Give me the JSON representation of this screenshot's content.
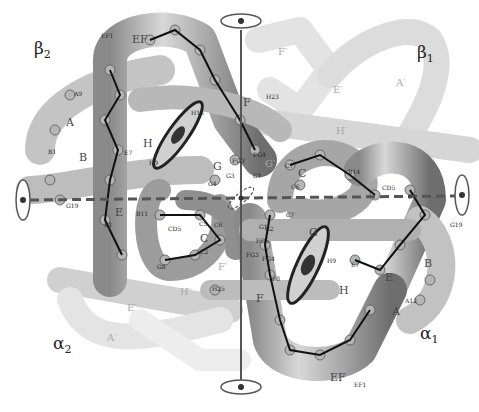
{
  "diagram": {
    "colors": {
      "background": "#ffffff",
      "tube_dark": "#7a7a7a",
      "tube_mid": "#a8a8a8",
      "tube_light": "#d4d4d4",
      "ghost": "#e6e6e6",
      "heme": "#555555",
      "axis": "#555555"
    },
    "chains": [
      {
        "id": "beta2",
        "symbol": "β",
        "sub": "2",
        "x": 34,
        "y": 40
      },
      {
        "id": "beta1",
        "symbol": "β",
        "sub": "1",
        "x": 417,
        "y": 44
      },
      {
        "id": "alpha2",
        "symbol": "α",
        "sub": "2",
        "x": 53,
        "y": 335
      },
      {
        "id": "alpha1",
        "symbol": "α",
        "sub": "1",
        "x": 420,
        "y": 325
      }
    ],
    "helix_labels": [
      {
        "text": "EF",
        "x": 132,
        "y": 34
      },
      {
        "text": "F",
        "x": 243,
        "y": 97
      },
      {
        "text": "H",
        "x": 143,
        "y": 138
      },
      {
        "text": "B",
        "x": 79,
        "y": 152
      },
      {
        "text": "A",
        "x": 66,
        "y": 117
      },
      {
        "text": "G",
        "x": 213,
        "y": 161
      },
      {
        "text": "E",
        "x": 115,
        "y": 207
      },
      {
        "text": "C",
        "x": 200,
        "y": 233
      },
      {
        "text": "C",
        "x": 298,
        "y": 168
      },
      {
        "text": "G",
        "x": 309,
        "y": 227
      },
      {
        "text": "H",
        "x": 339,
        "y": 285
      },
      {
        "text": "E",
        "x": 385,
        "y": 272
      },
      {
        "text": "B",
        "x": 424,
        "y": 258
      },
      {
        "text": "A",
        "x": 392,
        "y": 306
      },
      {
        "text": "F",
        "x": 256,
        "y": 293
      },
      {
        "text": "EF",
        "x": 330,
        "y": 372
      }
    ],
    "ghost_labels": [
      {
        "text": "F′",
        "x": 278,
        "y": 47
      },
      {
        "text": "E′",
        "x": 333,
        "y": 85
      },
      {
        "text": "A′",
        "x": 396,
        "y": 78
      },
      {
        "text": "H′",
        "x": 336,
        "y": 126
      },
      {
        "text": "G′",
        "x": 265,
        "y": 159
      },
      {
        "text": "F′",
        "x": 218,
        "y": 262
      },
      {
        "text": "H′",
        "x": 180,
        "y": 287
      },
      {
        "text": "E′",
        "x": 127,
        "y": 303
      },
      {
        "text": "A′",
        "x": 107,
        "y": 333
      }
    ],
    "residue_labels": [
      {
        "text": "EF1",
        "x": 101,
        "y": 33
      },
      {
        "text": "A9",
        "x": 74,
        "y": 91
      },
      {
        "text": "H15",
        "x": 191,
        "y": 110
      },
      {
        "text": "H23",
        "x": 266,
        "y": 94
      },
      {
        "text": "B1",
        "x": 48,
        "y": 149
      },
      {
        "text": "E7",
        "x": 124,
        "y": 150
      },
      {
        "text": "H9",
        "x": 149,
        "y": 160
      },
      {
        "text": "G19",
        "x": 66,
        "y": 203
      },
      {
        "text": "E1",
        "x": 104,
        "y": 222
      },
      {
        "text": "B11",
        "x": 136,
        "y": 211
      },
      {
        "text": "CD5",
        "x": 168,
        "y": 226
      },
      {
        "text": "FG4",
        "x": 253,
        "y": 152
      },
      {
        "text": "FG3",
        "x": 232,
        "y": 158
      },
      {
        "text": "G3",
        "x": 226,
        "y": 173
      },
      {
        "text": "G4",
        "x": 208,
        "y": 181
      },
      {
        "text": "G1",
        "x": 253,
        "y": 173
      },
      {
        "text": "C7",
        "x": 285,
        "y": 163
      },
      {
        "text": "C6",
        "x": 291,
        "y": 184
      },
      {
        "text": "B14",
        "x": 348,
        "y": 169
      },
      {
        "text": "CD5",
        "x": 382,
        "y": 185
      },
      {
        "text": "E1",
        "x": 408,
        "y": 194
      },
      {
        "text": "G19",
        "x": 450,
        "y": 222
      },
      {
        "text": "C7",
        "x": 286,
        "y": 212
      },
      {
        "text": "G1",
        "x": 259,
        "y": 224
      },
      {
        "text": "G2",
        "x": 265,
        "y": 226
      },
      {
        "text": "FG5",
        "x": 256,
        "y": 238
      },
      {
        "text": "FG3",
        "x": 246,
        "y": 252
      },
      {
        "text": "FG4",
        "x": 262,
        "y": 256
      },
      {
        "text": "H9",
        "x": 327,
        "y": 258
      },
      {
        "text": "E7",
        "x": 351,
        "y": 262
      },
      {
        "text": "F8",
        "x": 272,
        "y": 276
      },
      {
        "text": "H25",
        "x": 212,
        "y": 286
      },
      {
        "text": "A12",
        "x": 405,
        "y": 298
      },
      {
        "text": "EF1",
        "x": 354,
        "y": 382
      },
      {
        "text": "C5",
        "x": 199,
        "y": 221
      },
      {
        "text": "C6",
        "x": 214,
        "y": 222
      },
      {
        "text": "C2",
        "x": 200,
        "y": 249
      },
      {
        "text": "G8",
        "x": 157,
        "y": 264
      }
    ],
    "symmetry_axes": [
      {
        "id": "vertical-axis",
        "orientation": "vertical"
      },
      {
        "id": "horizontal-axis",
        "orientation": "horizontal"
      }
    ]
  }
}
